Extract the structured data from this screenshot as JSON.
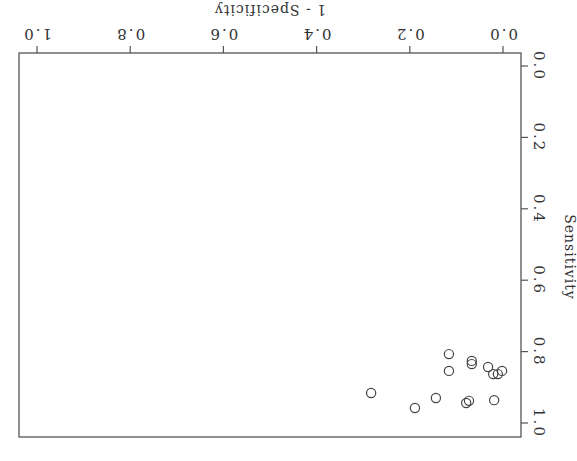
{
  "chart_data": {
    "type": "scatter",
    "title": "",
    "xlabel": "1 - Specificity",
    "ylabel": "Sensitivity",
    "xlim": [
      0.0,
      1.0
    ],
    "ylim": [
      0.0,
      1.0
    ],
    "x_ticks": [
      "0.0",
      "0.2",
      "0.4",
      "0.6",
      "0.8",
      "1.0"
    ],
    "y_ticks": [
      "0.0",
      "0.2",
      "0.4",
      "0.6",
      "0.8",
      "1.0"
    ],
    "grid": false,
    "legend": null,
    "orientation": "rotated 180 degrees",
    "marker": "open-circle",
    "series": [
      {
        "name": "studies",
        "points": [
          {
            "x": 0.116,
            "y": 0.807
          },
          {
            "x": 0.116,
            "y": 0.854
          },
          {
            "x": 0.067,
            "y": 0.826
          },
          {
            "x": 0.067,
            "y": 0.835
          },
          {
            "x": 0.032,
            "y": 0.843
          },
          {
            "x": 0.021,
            "y": 0.863
          },
          {
            "x": 0.011,
            "y": 0.863
          },
          {
            "x": 0.002,
            "y": 0.854
          },
          {
            "x": 0.283,
            "y": 0.916
          },
          {
            "x": 0.189,
            "y": 0.958
          },
          {
            "x": 0.144,
            "y": 0.93
          },
          {
            "x": 0.079,
            "y": 0.944
          },
          {
            "x": 0.073,
            "y": 0.938
          },
          {
            "x": 0.019,
            "y": 0.936
          }
        ]
      }
    ]
  }
}
